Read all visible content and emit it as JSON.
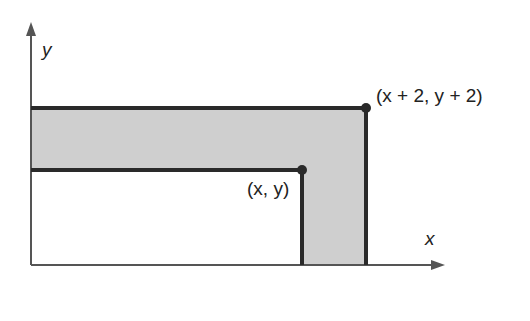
{
  "diagram": {
    "axes": {
      "x_label": "x",
      "y_label": "y"
    },
    "points": {
      "inner_corner": "(x, y)",
      "outer_corner": "(x + 2, y + 2)"
    },
    "colors": {
      "shaded_region": "#cfcfcf",
      "lines": "#2a2a2a",
      "axes": "#555555"
    }
  }
}
